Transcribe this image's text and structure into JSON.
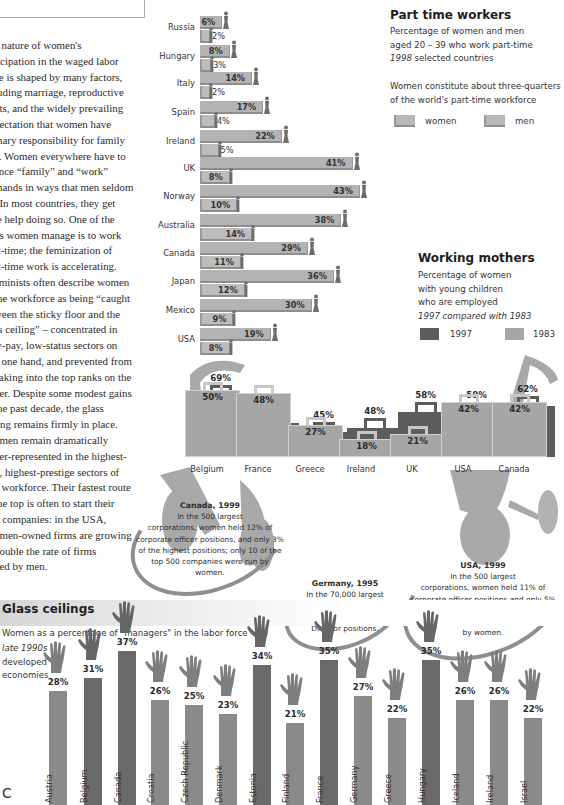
{
  "essay": {
    "lines": [
      "e nature of women's",
      "ticipation in the waged labor",
      "ce is shaped by many factors,",
      "luding marriage, reproductive",
      "nts, and the widely prevailing",
      "pectation that women have",
      "mary responsibility for family",
      "e. Women everywhere have to",
      "ance “family” and “work”",
      "mands in ways that men seldom",
      ". In most countries, they get",
      "le help doing so. One of the",
      "ys women manage is to work",
      "rt-time; the feminization of",
      "rt-time work is accelerating.",
      "eminists often describe women",
      "the workforce as being “caught",
      "ween the sticky floor and the",
      "ss ceiling” – concentrated in",
      "w-pay, low-status sectors on",
      "e one hand, and prevented from",
      "eaking into the top ranks on the",
      "her. Despite some modest gains",
      "the past decade, the glass",
      "ling remains firmly in place.",
      "omen remain dramatically",
      "der-represented in the highest-",
      "d, highest-prestige sectors of",
      "e workforce. Their fastest route",
      "the top is often to start their",
      "n companies: in the USA,",
      "omen-owned firms are growing",
      "double the rate of firms",
      "ned by men."
    ]
  },
  "part_time": {
    "title": "Part time workers",
    "subtitle_line1": "Percentage of women and men",
    "subtitle_line2": "aged 20 – 39 who work part-time",
    "subtitle_year": "1998",
    "subtitle_rest": " selected countries",
    "note_line1": "Women constitute about three-quarters",
    "note_line2": "of the world's part-time workforce",
    "legend_women": "women",
    "legend_men": "men"
  },
  "working_mothers": {
    "title": "Working mothers",
    "sub_line1": "Percentage of women",
    "sub_line2": "with young children",
    "sub_line3": "who are employed",
    "sub_italic": "1997 compared with 1983",
    "legend_1997": "1997",
    "legend_1983": "1983",
    "color_1997": "#5c5c5c",
    "color_1983": "#a6a6a6"
  },
  "callouts": {
    "canada": {
      "title": "Canada, 1999",
      "lines": [
        "In the 500 largest",
        "corporations, women held 12% of",
        "corporate officer positions, and only 3%",
        "of the highest positions; only 10 of the",
        "top 500 companies were run by",
        "women."
      ]
    },
    "germany": {
      "title": "Germany, 1995",
      "lines": [
        "In the 70,000 largest",
        "enterprises, women held 3% of",
        "the top executive and Board",
        "Director positions."
      ]
    },
    "usa": {
      "title": "USA, 1999",
      "lines": [
        "In the 500 largest",
        "corporations, women held 11% of",
        "corporate officer positions and only 5%",
        "of the most senior positions; only 3 of",
        "the top 500 companies were run",
        "by women."
      ]
    }
  },
  "glass": {
    "title": "Glass ceilings",
    "subtitle": "Women as a percentage of \"managers\" in the labor force",
    "sub_italic": "late 1990s",
    "sub_line2": "developed",
    "sub_line3": "economies"
  },
  "chart_data": [
    {
      "type": "bar",
      "title": "Part time workers",
      "subtitle": "Percentage of women and men aged 20 – 39 who work part-time, 1998, selected countries",
      "orientation": "horizontal",
      "categories": [
        "Russia",
        "Hungary",
        "Italy",
        "Spain",
        "Ireland",
        "UK",
        "Norway",
        "Australia",
        "Canada",
        "Japan",
        "Mexico",
        "USA"
      ],
      "series": [
        {
          "name": "women",
          "values": [
            6,
            8,
            14,
            17,
            22,
            41,
            43,
            38,
            29,
            36,
            30,
            19
          ]
        },
        {
          "name": "men",
          "values": [
            2,
            3,
            2,
            4,
            5,
            8,
            10,
            14,
            11,
            12,
            9,
            8
          ]
        }
      ],
      "xlabel": "",
      "ylabel": "",
      "unit": "%",
      "legend_position": "top-right"
    },
    {
      "type": "bar",
      "title": "Working mothers",
      "subtitle": "Percentage of women with young children who are employed, 1997 compared with 1983",
      "categories": [
        "Belgium",
        "France",
        "Greece",
        "Ireland",
        "UK",
        "USA",
        "Canada"
      ],
      "series": [
        {
          "name": "1997",
          "values": [
            69,
            51,
            45,
            48,
            58,
            58,
            62
          ]
        },
        {
          "name": "1983",
          "values": [
            50,
            48,
            27,
            18,
            21,
            42,
            42
          ]
        }
      ],
      "unit": "%",
      "legend_position": "right"
    },
    {
      "type": "bar",
      "title": "Glass ceilings",
      "subtitle": "Women as a percentage of \"managers\" in the labor force, late 1990s, developed economies",
      "categories": [
        "Austria",
        "Belgium",
        "Canada",
        "Croatia",
        "Czech Republic",
        "Denmark",
        "Estonia",
        "Finland",
        "France",
        "Germany",
        "Greece",
        "Hungary",
        "Iceland",
        "Ireland",
        "Israel"
      ],
      "values": [
        28,
        31,
        37,
        26,
        25,
        23,
        34,
        21,
        35,
        27,
        22,
        35,
        26,
        26,
        22
      ],
      "unit": "%"
    }
  ],
  "pt_rows": [
    {
      "country": "Russia",
      "women": "6%",
      "men": "2%"
    },
    {
      "country": "Hungary",
      "women": "8%",
      "men": "3%"
    },
    {
      "country": "Italy",
      "women": "14%",
      "men": "2%"
    },
    {
      "country": "Spain",
      "women": "17%",
      "men": "4%"
    },
    {
      "country": "Ireland",
      "women": "22%",
      "men": "5%"
    },
    {
      "country": "UK",
      "women": "41%",
      "men": "8%"
    },
    {
      "country": "Norway",
      "women": "43%",
      "men": "10%"
    },
    {
      "country": "Australia",
      "women": "38%",
      "men": "14%"
    },
    {
      "country": "Canada",
      "women": "29%",
      "men": "11%"
    },
    {
      "country": "Japan",
      "women": "36%",
      "men": "12%"
    },
    {
      "country": "Mexico",
      "women": "30%",
      "men": "9%"
    },
    {
      "country": "USA",
      "women": "19%",
      "men": "8%"
    }
  ],
  "wm_rows": [
    {
      "country": "Belgium",
      "v1997": "69%",
      "v1983": "50%"
    },
    {
      "country": "France",
      "v1997": "51%",
      "v1983": "48%"
    },
    {
      "country": "Greece",
      "v1997": "45%",
      "v1983": "27%"
    },
    {
      "country": "Ireland",
      "v1997": "48%",
      "v1983": "18%"
    },
    {
      "country": "UK",
      "v1997": "58%",
      "v1983": "21%"
    },
    {
      "country": "USA",
      "v1997": "58%",
      "v1983": "42%"
    },
    {
      "country": "Canada",
      "v1997": "62%",
      "v1983": "42%"
    }
  ],
  "gc_rows": [
    {
      "country": "Austria",
      "value": "28%"
    },
    {
      "country": "Belgium",
      "value": "31%"
    },
    {
      "country": "Canada",
      "value": "37%"
    },
    {
      "country": "Croatia",
      "value": "26%"
    },
    {
      "country": "Czech Republic",
      "value": "25%"
    },
    {
      "country": "Denmark",
      "value": "23%"
    },
    {
      "country": "Estonia",
      "value": "34%"
    },
    {
      "country": "Finland",
      "value": "21%"
    },
    {
      "country": "France",
      "value": "35%"
    },
    {
      "country": "Germany",
      "value": "27%"
    },
    {
      "country": "Greece",
      "value": "22%"
    },
    {
      "country": "Hungary",
      "value": "35%"
    },
    {
      "country": "Iceland",
      "value": "26%"
    },
    {
      "country": "Ireland",
      "value": "26%"
    },
    {
      "country": "Israel",
      "value": "22%"
    }
  ],
  "page_marker": "C"
}
